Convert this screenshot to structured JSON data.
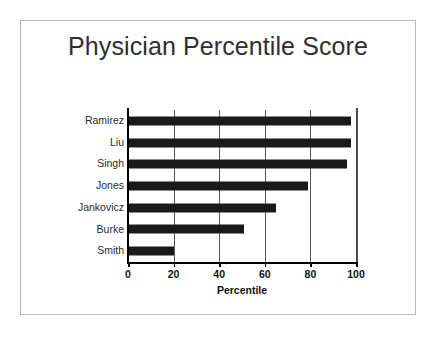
{
  "chart_data": {
    "type": "bar",
    "orientation": "horizontal",
    "title": "Physician Percentile Score",
    "xlabel": "Percentile",
    "ylabel": "",
    "categories": [
      "Ramirez",
      "Liu",
      "Singh",
      "Jones",
      "Jankovicz",
      "Burke",
      "Smith"
    ],
    "values": [
      98,
      98,
      96,
      79,
      65,
      51,
      20
    ],
    "xlim": [
      0,
      100
    ],
    "xticks": [
      0,
      20,
      40,
      60,
      80,
      100
    ],
    "xtick_labels": [
      "0",
      "20",
      "40",
      "60",
      "80",
      "100"
    ],
    "gridlines": {
      "vertical_at": [
        20,
        40,
        60,
        80
      ],
      "horizontal": false
    },
    "legend": null,
    "bar_color": "#1a1a1a",
    "grid_color": "#545454",
    "axis_color": "#000000"
  },
  "slide": {
    "background_color": "#ffffff",
    "frame_color": "#b9b9b9"
  }
}
